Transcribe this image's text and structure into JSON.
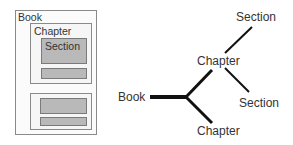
{
  "nested_view": {
    "book_label": "Book",
    "chapters": [
      {
        "label": "Chapter",
        "sections": [
          {
            "label": "Section"
          },
          {
            "label": ""
          }
        ]
      },
      {
        "label": "",
        "sections": [
          {
            "label": ""
          },
          {
            "label": ""
          }
        ]
      }
    ]
  },
  "tree_view": {
    "root": "Book",
    "chapter_top": "Chapter",
    "chapter_bottom": "Chapter",
    "section_top": "Section",
    "section_bottom": "Section"
  },
  "colors": {
    "border": "#8a8a8a",
    "section_fill": "#b9b9b9",
    "line": "#111111",
    "text": "#333333"
  }
}
